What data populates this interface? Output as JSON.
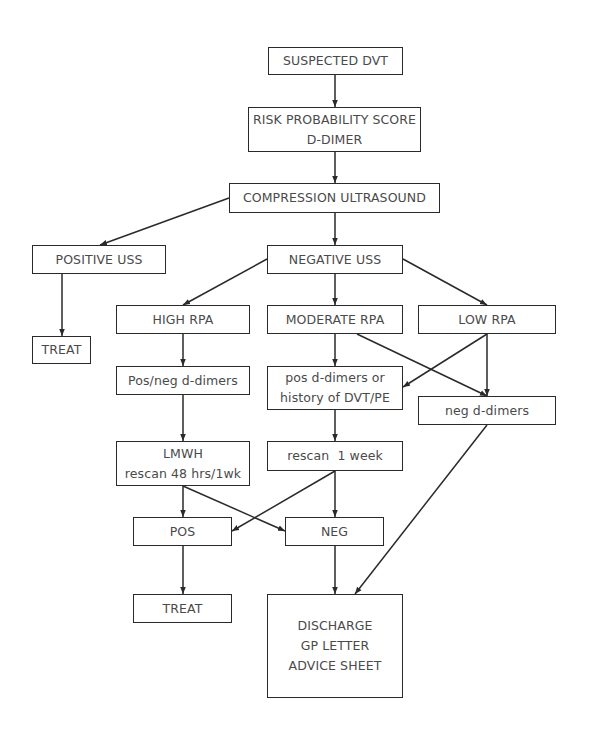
{
  "diagram": {
    "type": "flowchart",
    "nodes": {
      "suspected_dvt": {
        "lines": [
          "SUSPECTED DVT"
        ]
      },
      "risk_score": {
        "lines": [
          "RISK PROBABILITY SCORE",
          "D-DIMER"
        ]
      },
      "compression_us": {
        "lines": [
          "COMPRESSION ULTRASOUND"
        ]
      },
      "positive_uss": {
        "lines": [
          "POSITIVE USS"
        ]
      },
      "negative_uss": {
        "lines": [
          "NEGATIVE USS"
        ]
      },
      "treat_1": {
        "lines": [
          "TREAT"
        ]
      },
      "high_rpa": {
        "lines": [
          "HIGH RPA"
        ]
      },
      "moderate_rpa": {
        "lines": [
          "MODERATE RPA"
        ]
      },
      "low_rpa": {
        "lines": [
          "LOW RPA"
        ]
      },
      "pos_neg_ddimers": {
        "lines": [
          "Pos/neg d-dimers"
        ]
      },
      "pos_ddimers_history": {
        "lines": [
          "pos d-dimers or",
          "history of DVT/PE"
        ]
      },
      "neg_ddimers": {
        "lines": [
          "neg d-dimers"
        ]
      },
      "lmwh": {
        "lines": [
          "LMWH",
          "rescan 48 hrs/1wk"
        ]
      },
      "rescan_1wk": {
        "lines": [
          "rescan  1 week"
        ]
      },
      "pos": {
        "lines": [
          "POS"
        ]
      },
      "neg": {
        "lines": [
          "NEG"
        ]
      },
      "treat_2": {
        "lines": [
          "TREAT"
        ]
      },
      "discharge": {
        "lines": [
          "DISCHARGE",
          "GP LETTER",
          "ADVICE SHEET"
        ]
      }
    },
    "edges": [
      {
        "from": "suspected_dvt",
        "to": "risk_score"
      },
      {
        "from": "risk_score",
        "to": "compression_us"
      },
      {
        "from": "compression_us",
        "to": "positive_uss"
      },
      {
        "from": "compression_us",
        "to": "negative_uss"
      },
      {
        "from": "positive_uss",
        "to": "treat_1"
      },
      {
        "from": "negative_uss",
        "to": "high_rpa"
      },
      {
        "from": "negative_uss",
        "to": "moderate_rpa"
      },
      {
        "from": "negative_uss",
        "to": "low_rpa"
      },
      {
        "from": "high_rpa",
        "to": "pos_neg_ddimers"
      },
      {
        "from": "moderate_rpa",
        "to": "pos_ddimers_history"
      },
      {
        "from": "moderate_rpa",
        "to": "neg_ddimers"
      },
      {
        "from": "low_rpa",
        "to": "pos_ddimers_history"
      },
      {
        "from": "low_rpa",
        "to": "neg_ddimers"
      },
      {
        "from": "pos_neg_ddimers",
        "to": "lmwh"
      },
      {
        "from": "pos_ddimers_history",
        "to": "rescan_1wk"
      },
      {
        "from": "neg_ddimers",
        "to": "discharge"
      },
      {
        "from": "lmwh",
        "to": "pos"
      },
      {
        "from": "lmwh",
        "to": "neg"
      },
      {
        "from": "rescan_1wk",
        "to": "pos"
      },
      {
        "from": "rescan_1wk",
        "to": "neg"
      },
      {
        "from": "pos",
        "to": "treat_2"
      },
      {
        "from": "neg",
        "to": "discharge"
      }
    ]
  }
}
